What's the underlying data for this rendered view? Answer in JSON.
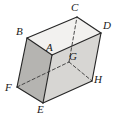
{
  "figure": {
    "name": "labeled-rectangular-prism",
    "type": "geometric-solid-diagram",
    "shape": "rectangular prism (cuboid)",
    "projection": "oblique parallel projection",
    "background_color": "#ffffff",
    "stroke_color": "#1a1a1a",
    "colors": {
      "top_face": "#f2f1ef",
      "left_face": "#b9b8b6",
      "front_face": "#d6d5d2",
      "outline": "#262626",
      "hidden_edge": "#333333",
      "label_text": "#1a1a1a"
    },
    "vertices": [
      {
        "id": "A",
        "label": "A",
        "x": 52,
        "y": 55,
        "label_x": 46,
        "label_y": 42,
        "hidden": false,
        "role": "front-top-left"
      },
      {
        "id": "B",
        "label": "B",
        "x": 27,
        "y": 38,
        "label_x": 16,
        "label_y": 26,
        "hidden": false,
        "role": "back-top-left"
      },
      {
        "id": "C",
        "label": "C",
        "x": 77,
        "y": 17,
        "label_x": 71,
        "label_y": 2,
        "hidden": false,
        "role": "back-top-right"
      },
      {
        "id": "D",
        "label": "D",
        "x": 101,
        "y": 33,
        "label_x": 103,
        "label_y": 20,
        "hidden": false,
        "role": "front-top-right"
      },
      {
        "id": "E",
        "label": "E",
        "x": 43,
        "y": 103,
        "label_x": 37,
        "label_y": 104,
        "hidden": false,
        "role": "front-bottom-left"
      },
      {
        "id": "F",
        "label": "F",
        "x": 17,
        "y": 87,
        "label_x": 5,
        "label_y": 82,
        "hidden": false,
        "role": "back-bottom-left"
      },
      {
        "id": "G",
        "label": "G",
        "x": 69,
        "y": 62,
        "label_x": 69,
        "label_y": 51,
        "hidden": true,
        "role": "back-bottom-right-hidden"
      },
      {
        "id": "H",
        "label": "H",
        "x": 92,
        "y": 81,
        "label_x": 94,
        "label_y": 74,
        "hidden": false,
        "role": "front-bottom-right"
      }
    ],
    "solid_edges": [
      [
        "B",
        "A"
      ],
      [
        "A",
        "D"
      ],
      [
        "D",
        "H"
      ],
      [
        "H",
        "E"
      ],
      [
        "E",
        "F"
      ],
      [
        "F",
        "B"
      ],
      [
        "A",
        "E"
      ],
      [
        "B",
        "C"
      ],
      [
        "C",
        "D"
      ]
    ],
    "dashed_edges": [
      [
        "F",
        "G"
      ],
      [
        "G",
        "C"
      ],
      [
        "G",
        "H"
      ]
    ],
    "edge_count": 12,
    "vertex_count": 8,
    "hidden_vertex": "G"
  }
}
